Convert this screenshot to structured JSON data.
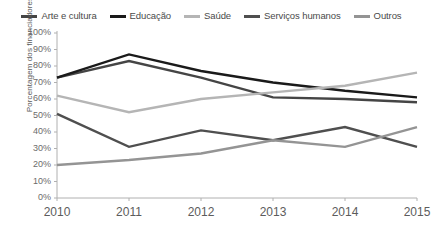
{
  "chart_data": {
    "type": "line",
    "title": "",
    "subtitle": "",
    "xlabel": "",
    "ylabel": "Porcentagem dos financiadores",
    "x": [
      "2010",
      "2011",
      "2012",
      "2013",
      "2014",
      "2015"
    ],
    "categories": [
      "2010",
      "2011",
      "2012",
      "2013",
      "2014",
      "2015"
    ],
    "ylim": [
      0,
      100
    ],
    "ytick_labels": [
      "100%",
      "90%",
      "80%",
      "70%",
      "60%",
      "50%",
      "40%",
      "30%",
      "20%",
      "10%",
      "0%"
    ],
    "ytick_values": [
      100,
      90,
      80,
      70,
      60,
      50,
      40,
      30,
      20,
      10,
      0
    ],
    "grid": false,
    "legend_position": "top",
    "series": [
      {
        "name": "Arte e cultura",
        "color": "#454545",
        "values": [
          73,
          83,
          73,
          61,
          60,
          58
        ]
      },
      {
        "name": "Educação",
        "color": "#1a1a1a",
        "values": [
          73,
          87,
          77,
          70,
          65,
          61
        ]
      },
      {
        "name": "Saúde",
        "color": "#b5b5b5",
        "values": [
          62,
          52,
          60,
          64,
          68,
          76
        ]
      },
      {
        "name": "Serviços humanos",
        "color": "#4f4f4f",
        "values": [
          51,
          31,
          41,
          35,
          43,
          31
        ]
      },
      {
        "name": "Outros",
        "color": "#949494",
        "values": [
          20,
          23,
          27,
          35,
          31,
          43
        ]
      }
    ]
  },
  "legend": {
    "items": [
      {
        "label": "Arte e cultura",
        "color": "#454545"
      },
      {
        "label": "Educação",
        "color": "#1a1a1a"
      },
      {
        "label": "Saúde",
        "color": "#b5b5b5"
      },
      {
        "label": "Serviços humanos",
        "color": "#4f4f4f"
      },
      {
        "label": "Outros",
        "color": "#949494"
      }
    ]
  },
  "axes": {
    "y_title": "Porcentagem dos financiadores",
    "axis_color": "#b0b0b0"
  }
}
